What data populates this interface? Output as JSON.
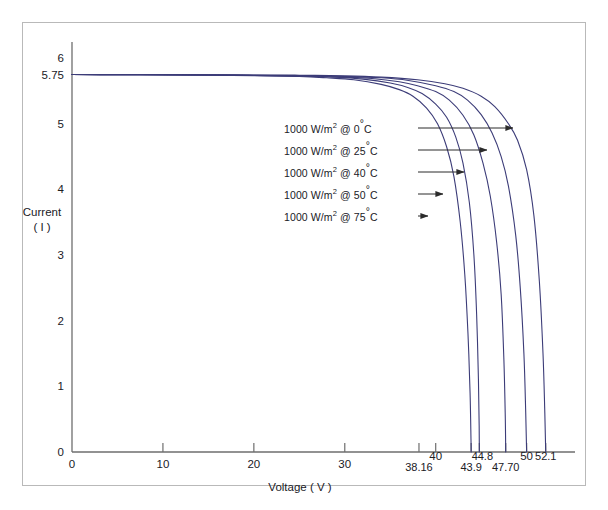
{
  "chart_data": {
    "type": "line",
    "title": "",
    "xlabel": "Voltage ( V )",
    "ylabel_line1": "Current",
    "ylabel_line2": "( I )",
    "xlim": [
      0,
      54
    ],
    "ylim": [
      0,
      6.2
    ],
    "grid": false,
    "legend_position": "inside-annotations-with-arrows",
    "line_color": "#3c3c78",
    "axis_color": "#6e6e6e",
    "frame_color": "#b9b9b9",
    "x_major_ticks": [
      "0",
      "10",
      "20",
      "30",
      "40",
      "50"
    ],
    "x_major_tick_values": [
      0,
      10,
      20,
      30,
      40,
      50
    ],
    "x_extra_ticks": [
      "38.16",
      "43.9",
      "44.8",
      "47.70",
      "52.1"
    ],
    "x_extra_tick_values": [
      38.16,
      43.9,
      44.8,
      47.7,
      52.1
    ],
    "y_ticks": [
      "0",
      "1",
      "2",
      "3",
      "4",
      "5",
      "5.75",
      "6"
    ],
    "y_tick_values": [
      0,
      1,
      2,
      3,
      4,
      5,
      5.75,
      6
    ],
    "isc": 5.75,
    "series": [
      {
        "name": "1000 W/m² @ 0°C",
        "irradiance": "1000 W/m²",
        "temperature": "0°C",
        "voc": 52.1,
        "isc": 5.75,
        "knee_voltage": 46.0,
        "arrow_label_y": 4.72,
        "points": [
          [
            0,
            5.75
          ],
          [
            5,
            5.75
          ],
          [
            10,
            5.749
          ],
          [
            15,
            5.747
          ],
          [
            20,
            5.744
          ],
          [
            25,
            5.74
          ],
          [
            30,
            5.73
          ],
          [
            34,
            5.71
          ],
          [
            38,
            5.67
          ],
          [
            41,
            5.61
          ],
          [
            43,
            5.54
          ],
          [
            45,
            5.42
          ],
          [
            46.5,
            5.26
          ],
          [
            48,
            5.0
          ],
          [
            49,
            4.75
          ],
          [
            50,
            4.3
          ],
          [
            50.8,
            3.6
          ],
          [
            51.4,
            2.6
          ],
          [
            51.8,
            1.5
          ],
          [
            52.0,
            0.6
          ],
          [
            52.1,
            0
          ]
        ]
      },
      {
        "name": "1000 W/m² @ 25°C",
        "irradiance": "1000 W/m²",
        "temperature": "25°C",
        "voc": 50.0,
        "isc": 5.75,
        "knee_voltage": 44.0,
        "arrow_label_y": 4.38,
        "points": [
          [
            0,
            5.75
          ],
          [
            5,
            5.749
          ],
          [
            10,
            5.748
          ],
          [
            15,
            5.745
          ],
          [
            20,
            5.74
          ],
          [
            25,
            5.735
          ],
          [
            30,
            5.72
          ],
          [
            34,
            5.7
          ],
          [
            37,
            5.66
          ],
          [
            40,
            5.58
          ],
          [
            42,
            5.49
          ],
          [
            43.5,
            5.36
          ],
          [
            45,
            5.14
          ],
          [
            46.2,
            4.86
          ],
          [
            47.2,
            4.5
          ],
          [
            48,
            4.05
          ],
          [
            48.8,
            3.3
          ],
          [
            49.3,
            2.5
          ],
          [
            49.7,
            1.5
          ],
          [
            49.9,
            0.6
          ],
          [
            50.0,
            0
          ]
        ]
      },
      {
        "name": "1000 W/m² @ 40°C",
        "irradiance": "1000 W/m²",
        "temperature": "40°C",
        "voc": 47.7,
        "isc": 5.75,
        "knee_voltage": 42.0,
        "arrow_label_y": 4.05,
        "points": [
          [
            0,
            5.75
          ],
          [
            5,
            5.749
          ],
          [
            10,
            5.747
          ],
          [
            15,
            5.744
          ],
          [
            20,
            5.738
          ],
          [
            25,
            5.73
          ],
          [
            30,
            5.71
          ],
          [
            33,
            5.69
          ],
          [
            36,
            5.64
          ],
          [
            38,
            5.58
          ],
          [
            40,
            5.49
          ],
          [
            41.5,
            5.36
          ],
          [
            43,
            5.13
          ],
          [
            44.2,
            4.83
          ],
          [
            45.2,
            4.4
          ],
          [
            46,
            3.9
          ],
          [
            46.7,
            3.2
          ],
          [
            47.2,
            2.4
          ],
          [
            47.5,
            1.4
          ],
          [
            47.65,
            0.55
          ],
          [
            47.7,
            0
          ]
        ]
      },
      {
        "name": "1000 W/m² @ 50°C",
        "irradiance": "1000 W/m²",
        "temperature": "50°C",
        "voc": 44.8,
        "isc": 5.75,
        "knee_voltage": 39.5,
        "arrow_label_y": 3.72,
        "points": [
          [
            0,
            5.75
          ],
          [
            5,
            5.748
          ],
          [
            10,
            5.746
          ],
          [
            15,
            5.742
          ],
          [
            20,
            5.735
          ],
          [
            25,
            5.725
          ],
          [
            29,
            5.71
          ],
          [
            32,
            5.68
          ],
          [
            35,
            5.62
          ],
          [
            37,
            5.55
          ],
          [
            38.5,
            5.46
          ],
          [
            40,
            5.3
          ],
          [
            41.2,
            5.1
          ],
          [
            42.2,
            4.8
          ],
          [
            43,
            4.4
          ],
          [
            43.7,
            3.8
          ],
          [
            44.2,
            3.0
          ],
          [
            44.5,
            2.1
          ],
          [
            44.7,
            1.1
          ],
          [
            44.78,
            0.4
          ],
          [
            44.8,
            0
          ]
        ]
      },
      {
        "name": "1000 W/m² @ 75°C",
        "irradiance": "1000 W/m²",
        "temperature": "75°C",
        "voc": 43.9,
        "isc": 5.75,
        "knee_voltage": 38.16,
        "arrow_label_y": 3.4,
        "points": [
          [
            0,
            5.75
          ],
          [
            5,
            5.748
          ],
          [
            10,
            5.745
          ],
          [
            15,
            5.74
          ],
          [
            20,
            5.732
          ],
          [
            25,
            5.72
          ],
          [
            28,
            5.7
          ],
          [
            31,
            5.67
          ],
          [
            34,
            5.6
          ],
          [
            36,
            5.52
          ],
          [
            37.5,
            5.42
          ],
          [
            39,
            5.24
          ],
          [
            40.2,
            5.0
          ],
          [
            41.2,
            4.65
          ],
          [
            42,
            4.2
          ],
          [
            42.7,
            3.5
          ],
          [
            43.2,
            2.7
          ],
          [
            43.55,
            1.8
          ],
          [
            43.78,
            0.9
          ],
          [
            43.88,
            0.2
          ],
          [
            43.9,
            0
          ]
        ]
      }
    ],
    "annotations": [
      {
        "label": "1000 W/m² @  0°C",
        "arrow_from_x": 418,
        "arrow_to_x": 513,
        "arrow_y": 128
      },
      {
        "label": "1000 W/m² @ 25°C",
        "arrow_from_x": 418,
        "arrow_to_x": 487,
        "arrow_y": 150
      },
      {
        "label": "1000 W/m² @ 40°C",
        "arrow_from_x": 418,
        "arrow_to_x": 464,
        "arrow_y": 172
      },
      {
        "label": "1000 W/m² @ 50°C",
        "arrow_from_x": 418,
        "arrow_to_x": 443,
        "arrow_y": 194
      },
      {
        "label": "1000 W/m² @ 75°C",
        "arrow_from_x": 418,
        "arrow_to_x": 428,
        "arrow_y": 216
      }
    ]
  },
  "legend_items": [
    {
      "prefix": "1000 W/m",
      "sup": "2",
      "at": " @  0",
      "deg": "°",
      "unit": "C"
    },
    {
      "prefix": "1000 W/m",
      "sup": "2",
      "at": " @ 25",
      "deg": "°",
      "unit": "C"
    },
    {
      "prefix": "1000 W/m",
      "sup": "2",
      "at": " @ 40",
      "deg": "°",
      "unit": "C"
    },
    {
      "prefix": "1000 W/m",
      "sup": "2",
      "at": " @ 50",
      "deg": "°",
      "unit": "C"
    },
    {
      "prefix": "1000 W/m",
      "sup": "2",
      "at": " @ 75",
      "deg": "°",
      "unit": "C"
    }
  ]
}
